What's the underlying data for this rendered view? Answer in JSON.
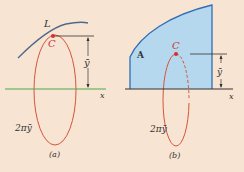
{
  "colors": {
    "background": "#f8e4d2",
    "curve": "#4d6a88",
    "centroid": "#d42f2f",
    "ellipse": "#d4553a",
    "axis_a": "#4aa94a",
    "axis_b": "#333333",
    "region_fill": "#b6d8ee",
    "region_stroke": "#2f6fb3",
    "label_red": "#c8373a"
  },
  "panel_a": {
    "curve_label": "L",
    "centroid_label": "C",
    "distance_label": "ȳ",
    "axis_label": "x",
    "circumference_label": "2πȳ",
    "caption": "(a)"
  },
  "panel_b": {
    "area_label": "A",
    "centroid_label": "C",
    "distance_label": "ȳ",
    "axis_label": "x",
    "circumference_label": "2πȳ",
    "caption": "(b)"
  }
}
